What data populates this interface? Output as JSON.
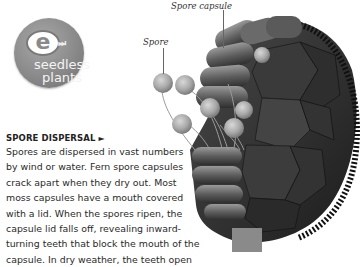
{
  "badge": {
    "logo_letter": "e",
    "logo_glyph": "fast-forward-icon",
    "logo_glyph_text": "⏭",
    "label_line1": "seedless",
    "label_line2": "plants",
    "color": "#8a8a8a"
  },
  "section": {
    "heading": "SPORE DISPERSAL",
    "heading_arrow": "►",
    "body_lines": [
      "Spores are dispersed in vast numbers",
      "by wind or water. Fern spore capsules",
      "crack apart when they dry out. Most",
      "moss capsules have a mouth covered",
      "with a lid. When the spores ripen, the",
      "capsule lid falls off, revealing inward-",
      "turning teeth that block the mouth of the",
      "capsule. In dry weather, the teeth open"
    ]
  },
  "illustration": {
    "subject": "moss spore capsule releasing spores",
    "labels": {
      "spore_capsule": "Spore capsule",
      "spore": "Spore"
    }
  }
}
